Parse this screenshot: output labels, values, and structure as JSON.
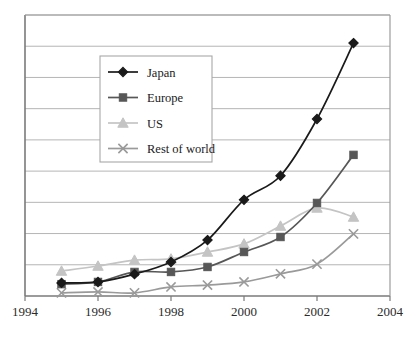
{
  "chart_data": {
    "type": "line",
    "title": "",
    "subtitle": "",
    "xlabel": "",
    "ylabel": "",
    "xlim": [
      1994,
      2004
    ],
    "ylim": [
      0,
      9
    ],
    "grid": "horizontal",
    "legend_position": "upper-left-inside",
    "x": [
      1995,
      1996,
      1997,
      1998,
      1999,
      2000,
      2001,
      2002,
      2003
    ],
    "xticks": [
      "1994",
      "1996",
      "1998",
      "2000",
      "2002",
      "2004"
    ],
    "xtick_values": [
      1994,
      1996,
      1998,
      2000,
      2002,
      2004
    ],
    "yticks": [],
    "series": [
      {
        "name": "Japan",
        "color": "#1a1a1a",
        "marker": "diamond",
        "values": [
          0.42,
          0.45,
          0.7,
          1.09,
          1.79,
          3.08,
          3.85,
          5.67,
          8.1
        ]
      },
      {
        "name": "Europe",
        "color": "#575757",
        "marker": "square",
        "values": [
          0.38,
          0.45,
          0.77,
          0.77,
          0.93,
          1.41,
          1.89,
          2.98,
          4.52
        ]
      },
      {
        "name": "US",
        "color": "#c4c4c4",
        "marker": "triangle",
        "values": [
          0.8,
          0.96,
          1.15,
          1.19,
          1.41,
          1.67,
          2.24,
          2.82,
          2.53
        ]
      },
      {
        "name": "Rest of world",
        "color": "#9a9a9a",
        "marker": "cross",
        "values": [
          0.1,
          0.13,
          0.1,
          0.29,
          0.35,
          0.45,
          0.71,
          1.02,
          1.99
        ]
      }
    ]
  },
  "legend": {
    "entries": [
      {
        "label": "Japan",
        "icon": "diamond-marker-icon"
      },
      {
        "label": "Europe",
        "icon": "square-marker-icon"
      },
      {
        "label": "US",
        "icon": "triangle-marker-icon"
      },
      {
        "label": "Rest of world",
        "icon": "cross-marker-icon"
      }
    ]
  },
  "axis": {
    "x_tick_labels": [
      "1994",
      "1996",
      "1998",
      "2000",
      "2002",
      "2004"
    ]
  },
  "colors": {
    "japan": "#1a1a1a",
    "europe": "#575757",
    "us": "#c4c4c4",
    "rest_of_world": "#9a9a9a",
    "gridline": "#b5b5b5",
    "axis": "#6b6b6b",
    "background": "#ffffff",
    "legend_border": "#a8a8a8"
  }
}
